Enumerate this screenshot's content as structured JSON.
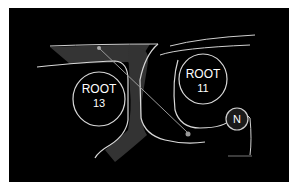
{
  "diagram": {
    "background": "#000000",
    "nodes": [
      {
        "id": "root13",
        "line1": "ROOT",
        "line2": "13"
      },
      {
        "id": "root11",
        "line1": "ROOT",
        "line2": "11"
      },
      {
        "id": "n",
        "line1": "N"
      }
    ],
    "colors": {
      "band": "#3a3a3a",
      "line": "#d8d8d8",
      "text": "#ffffff"
    }
  }
}
